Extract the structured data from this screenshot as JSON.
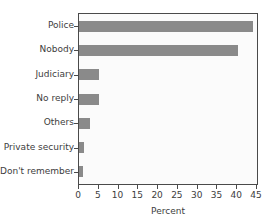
{
  "figure": {
    "title_sliver": "",
    "background_color": "#ffffff",
    "plot_background_color": "#fbfbfb",
    "frame_color": "#4a4a4a",
    "bar_color": "#8a8a8a",
    "text_color": "#3d3d3d"
  },
  "chart_data": {
    "type": "bar",
    "orientation": "horizontal",
    "title": "",
    "xlabel": "Percent",
    "ylabel": "",
    "categories": [
      "Police",
      "Nobody",
      "Judiciary",
      "No reply",
      "Others",
      "Private security",
      "Don't remember"
    ],
    "values": [
      44.0,
      40.2,
      5.0,
      5.0,
      2.8,
      1.3,
      0.9
    ],
    "xlim": [
      0,
      45
    ],
    "ylim": [
      0,
      7
    ],
    "xticks": [
      0,
      5,
      10,
      15,
      20,
      25,
      30,
      35,
      40,
      45
    ],
    "xticklabels": [
      "0",
      "5",
      "10",
      "15",
      "20",
      "25",
      "30",
      "35",
      "40",
      "45"
    ],
    "grid": false,
    "legend": null,
    "series": [
      {
        "name": "Percent",
        "values": [
          44.0,
          40.2,
          5.0,
          5.0,
          2.8,
          1.3,
          0.9
        ]
      }
    ]
  }
}
